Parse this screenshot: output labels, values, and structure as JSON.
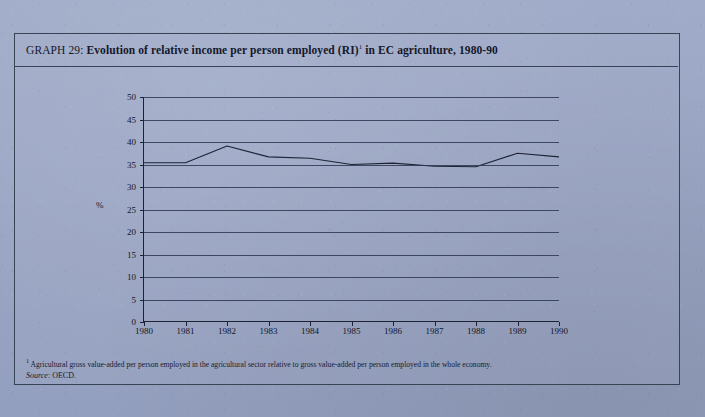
{
  "figure": {
    "title_lead": "GRAPH 29",
    "title_separator": ": ",
    "title_main": "Evolution of relative income per person employed (RI)",
    "title_footnote_marker": "1",
    "title_tail": " in EC agriculture, 1980-90",
    "footnote_marker": "1",
    "footnote_text": " Agricultural gross value-added per person employed in the agricultural sector relative to gross value-added per person employed in the whole economy.",
    "source_label": "Source",
    "source_separator": ": ",
    "source_value": "OECD.",
    "y_axis_unit": "%",
    "frame_color": "#3a4256",
    "line_color": "#1d2235",
    "background_color": "#9aa6c4"
  },
  "chart_data": {
    "type": "line",
    "xlabel": "",
    "ylabel": "%",
    "ylim": [
      0,
      50
    ],
    "xlim": [
      1980,
      1990
    ],
    "grid": true,
    "legend": false,
    "y_ticks": [
      0,
      5,
      10,
      15,
      20,
      25,
      30,
      35,
      40,
      45,
      50
    ],
    "y_tick_labels": [
      "0",
      "5",
      "10",
      "15",
      "20",
      "25",
      "30",
      "35",
      "40",
      "45",
      "50"
    ],
    "categories": [
      1980,
      1981,
      1982,
      1983,
      1984,
      1985,
      1986,
      1987,
      1988,
      1989,
      1990
    ],
    "x_tick_labels": [
      "1980",
      "1981",
      "1982",
      "1983",
      "1984",
      "1985",
      "1986",
      "1987",
      "1988",
      "1989",
      "1990"
    ],
    "series": [
      {
        "name": "Relative income per person employed (RI)",
        "values": [
          35.4,
          35.4,
          39.1,
          36.7,
          36.4,
          35.0,
          35.3,
          34.6,
          34.5,
          37.5,
          36.7
        ]
      }
    ]
  }
}
